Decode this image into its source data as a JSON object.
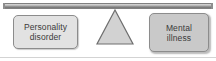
{
  "diagram": {
    "type": "balance-scale",
    "beam": {
      "name": "balance-beam",
      "color": "#9a9a9a"
    },
    "fulcrum": {
      "name": "fulcrum-triangle",
      "fill": "#d2d2d2",
      "stroke": "#6e6e6e"
    },
    "ground": {
      "color": "#d3d3d3"
    },
    "items": [
      {
        "id": "personality-disorder",
        "label": "Personality\ndisorder",
        "side": "left",
        "fill": "#e2e2e2",
        "border": "#8c8c8c",
        "text_color": "#3a3a3a"
      },
      {
        "id": "mental-illness",
        "label": "Mental\nillness",
        "side": "right",
        "fill": "#c9c9c9",
        "border": "#8c8c8c",
        "text_color": "#3a3a3a"
      }
    ]
  }
}
